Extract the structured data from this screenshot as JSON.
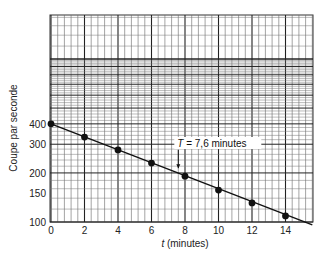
{
  "chart_data": {
    "type": "scatter",
    "title": "",
    "xlabel_italic": "t",
    "xlabel_rest": " (minutes)",
    "ylabel": "Coupe par seconde",
    "yscale": "log",
    "xlim": [
      0,
      15.5
    ],
    "ylim": [
      100,
      1860
    ],
    "grid": true,
    "x_ticks": [
      0,
      2,
      4,
      6,
      8,
      10,
      12,
      14
    ],
    "x_tick_labels": [
      "0",
      "2",
      "4",
      "6",
      "8",
      "10",
      "12",
      "14"
    ],
    "y_ticks": [
      100,
      150,
      200,
      300,
      400
    ],
    "y_tick_labels": [
      "100",
      "150",
      "200",
      "300",
      "400"
    ],
    "series": [
      {
        "name": "Mesures",
        "x": [
          0,
          2,
          4,
          6,
          8,
          10,
          12,
          14
        ],
        "y": [
          400,
          332,
          277,
          230,
          191,
          157,
          131,
          109
        ],
        "markers": true,
        "fit_line": true
      }
    ],
    "fit_line": {
      "x": [
        0,
        15.6
      ],
      "y": [
        400,
        96
      ]
    },
    "annotations": [
      {
        "text_italic": "T",
        "text_rest": " = 7,6 minutes",
        "x": 7.6,
        "arrow_to_y": 205
      }
    ]
  }
}
